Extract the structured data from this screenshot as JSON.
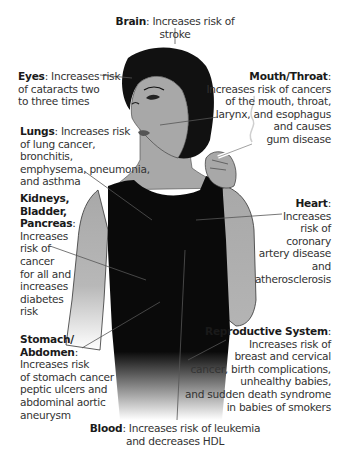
{
  "diagram": {
    "colors": {
      "skin": "#a8a8a8",
      "hair": "#111111",
      "top": "#0a0a0a",
      "leader": "#555555",
      "text": "#333333"
    },
    "labels": [
      {
        "id": "brain",
        "organ": "Brain",
        "sep": ":",
        "lines": [
          "Increases risk of stroke"
        ]
      },
      {
        "id": "eyes",
        "organ": "Eyes",
        "sep": ":",
        "lines": [
          "Increases risk",
          "of cataracts two",
          "to three times"
        ]
      },
      {
        "id": "mouth",
        "organ": "Mouth/Throat",
        "sep": ":",
        "lines": [
          "Increases risk of cancers",
          "of the mouth, throat,",
          "larynx, and esophagus",
          "and causes",
          "gum disease"
        ]
      },
      {
        "id": "lungs",
        "organ": "Lungs",
        "sep": ":",
        "lines": [
          "Increases risk",
          "of lung cancer, bronchitis,",
          "emphysema, pneumonia,",
          "and asthma"
        ]
      },
      {
        "id": "kidneys",
        "organ_lines": [
          "Kidneys,",
          "Bladder,",
          "Pancreas"
        ],
        "sep": ":",
        "lines": [
          "Increases",
          "risk of",
          "cancer",
          "for all and",
          "increases",
          "diabetes",
          "risk"
        ]
      },
      {
        "id": "heart",
        "organ": "Heart",
        "sep": ":",
        "lines": [
          "Increases",
          "risk of",
          "coronary",
          "artery disease",
          "and",
          "atherosclerosis"
        ]
      },
      {
        "id": "stomach",
        "organ_lines": [
          "Stomach/",
          "Abdomen"
        ],
        "sep": ":",
        "lines": [
          "Increases risk",
          "of stomach cancer",
          "peptic ulcers and",
          "abdominal aortic",
          "aneurysm"
        ]
      },
      {
        "id": "reproductive",
        "organ": "Reproductive System",
        "sep": ":",
        "lines": [
          "Increases risk of",
          "breast and cervical",
          "cancer, birth complications,",
          "unhealthy babies,",
          "and sudden death syndrome",
          "in babies of smokers"
        ]
      },
      {
        "id": "blood",
        "organ": "Blood",
        "sep": ":",
        "lines": [
          "Increases risk of leukemia",
          "and decreases HDL"
        ]
      }
    ]
  }
}
